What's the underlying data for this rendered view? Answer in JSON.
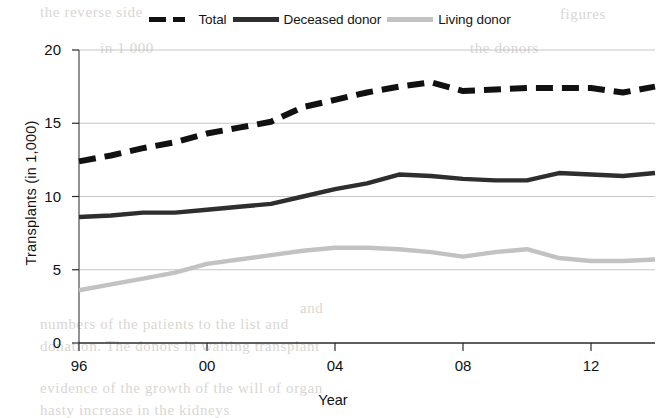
{
  "chart_data": {
    "type": "line",
    "title": "",
    "xlabel": "Year",
    "ylabel": "Transplants (in 1,000)",
    "xlim": [
      1996,
      2014
    ],
    "ylim": [
      0,
      20
    ],
    "yticks": [
      0,
      5,
      10,
      15,
      20
    ],
    "ytick_labels": [
      "0",
      "5",
      "10",
      "15",
      "20"
    ],
    "xticks": [
      1996,
      2000,
      2004,
      2008,
      2012
    ],
    "xtick_labels": [
      "96",
      "00",
      "04",
      "08",
      "12"
    ],
    "grid": "horizontal",
    "legend_position": "top-center",
    "x": [
      1996,
      1997,
      1998,
      1999,
      2000,
      2001,
      2002,
      2003,
      2004,
      2005,
      2006,
      2007,
      2008,
      2009,
      2010,
      2011,
      2012,
      2013,
      2014
    ],
    "series": [
      {
        "name": "Total",
        "style": "dashed",
        "color": "#111111",
        "values": [
          12.4,
          12.8,
          13.3,
          13.7,
          14.3,
          14.7,
          15.1,
          16.1,
          16.6,
          17.1,
          17.5,
          17.8,
          17.2,
          17.3,
          17.4,
          17.4,
          17.4,
          17.1,
          17.5
        ]
      },
      {
        "name": "Deceased donor",
        "style": "solid",
        "color": "#2e2e2e",
        "values": [
          8.6,
          8.7,
          8.9,
          8.9,
          9.1,
          9.3,
          9.5,
          10.0,
          10.5,
          10.9,
          11.5,
          11.4,
          11.2,
          11.1,
          11.1,
          11.6,
          11.5,
          11.4,
          11.6
        ]
      },
      {
        "name": "Living donor",
        "style": "solid",
        "color": "#c2c2c2",
        "values": [
          3.6,
          4.0,
          4.4,
          4.8,
          5.4,
          5.7,
          6.0,
          6.3,
          6.5,
          6.5,
          6.4,
          6.2,
          5.9,
          6.2,
          6.4,
          5.8,
          5.6,
          5.6,
          5.7
        ]
      }
    ]
  },
  "legend": {
    "entries": [
      {
        "label": "Total"
      },
      {
        "label": "Deceased donor"
      },
      {
        "label": "Living donor"
      }
    ]
  },
  "axes": {
    "x_title": "Year",
    "y_title": "Transplants (in 1,000)"
  },
  "bleed_text": [
    {
      "text": "the reverse side",
      "left": 40,
      "top": 4
    },
    {
      "text": "figures",
      "left": 560,
      "top": 6
    },
    {
      "text": "in 1 000",
      "left": 100,
      "top": 40
    },
    {
      "text": "the donors",
      "left": 470,
      "top": 40
    },
    {
      "text": "and",
      "left": 300,
      "top": 300
    },
    {
      "text": "numbers of the patients to the list and",
      "left": 40,
      "top": 316
    },
    {
      "text": "donation. The donors in waiting transplant",
      "left": 40,
      "top": 338
    },
    {
      "text": "evidence of the growth of the will of organ",
      "left": 40,
      "top": 380
    },
    {
      "text": "hasty increase in the kidneys",
      "left": 40,
      "top": 402
    }
  ]
}
